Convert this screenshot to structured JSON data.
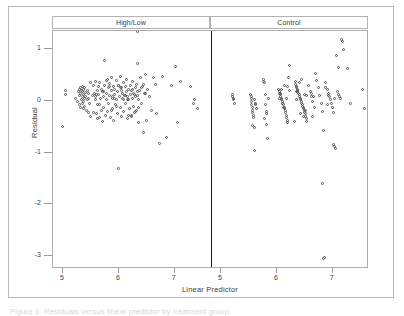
{
  "figure": {
    "panel_headers": [
      "High/Low",
      "Control"
    ],
    "xlabel": "Linear Predictor",
    "ylabel": "Residual",
    "caption_partial": "Figure 1. Residuals versus linear predictor by treatment group.",
    "colors": {
      "frame": "#aeaeae",
      "outer_border": "#b9b9b9",
      "divider": "#1a1a1a",
      "marker": "#555555",
      "text": "#3d3d3d",
      "background": "#ffffff"
    }
  },
  "chart_data": {
    "type": "scatter",
    "title": "",
    "xlabel": "Linear Predictor",
    "ylabel": "Residual",
    "xlim": [
      4.82,
      7.65
    ],
    "ylim": [
      -3.25,
      1.35
    ],
    "yticks": [
      1,
      0,
      -1,
      -2,
      -3
    ],
    "xticks": [
      5,
      6,
      7
    ],
    "grid": false,
    "legend": null,
    "marker": "open-circle",
    "panel_layout": "1x2",
    "panels": [
      {
        "name": "High/Low",
        "x": [
          4.99,
          5.05,
          5.05,
          5.23,
          5.26,
          5.28,
          5.29,
          5.3,
          5.3,
          5.31,
          5.32,
          5.32,
          5.33,
          5.33,
          5.34,
          5.34,
          5.35,
          5.35,
          5.36,
          5.36,
          5.37,
          5.37,
          5.38,
          5.38,
          5.39,
          5.4,
          5.41,
          5.42,
          5.43,
          5.44,
          5.45,
          5.46,
          5.47,
          5.49,
          5.52,
          5.55,
          5.56,
          5.58,
          5.59,
          5.6,
          5.61,
          5.62,
          5.63,
          5.64,
          5.65,
          5.66,
          5.67,
          5.68,
          5.69,
          5.7,
          5.71,
          5.72,
          5.73,
          5.74,
          5.75,
          5.76,
          5.77,
          5.78,
          5.79,
          5.8,
          5.81,
          5.82,
          5.83,
          5.84,
          5.85,
          5.86,
          5.87,
          5.88,
          5.89,
          5.9,
          5.91,
          5.92,
          5.93,
          5.94,
          5.95,
          5.96,
          5.97,
          5.98,
          5.99,
          6.0,
          6.01,
          6.02,
          6.03,
          6.04,
          6.05,
          6.06,
          6.07,
          6.08,
          6.09,
          6.1,
          6.11,
          6.12,
          6.13,
          6.14,
          6.15,
          6.16,
          6.17,
          6.18,
          6.19,
          6.2,
          6.21,
          6.22,
          6.23,
          6.24,
          6.25,
          6.26,
          6.27,
          6.28,
          6.29,
          6.3,
          6.31,
          6.32,
          6.33,
          6.34,
          6.35,
          6.36,
          6.37,
          6.38,
          6.4,
          6.42,
          6.44,
          6.46,
          6.48,
          6.5,
          6.52,
          6.55,
          6.58,
          6.62,
          6.65,
          6.68,
          6.72,
          6.78,
          6.85,
          6.95,
          7.02,
          7.05,
          7.1,
          7.28,
          7.34,
          7.36,
          7.4,
          5.72,
          6.02,
          6.3,
          5.6,
          5.88,
          6.18,
          6.44,
          5.45,
          5.95,
          6.25,
          6.48,
          5.66,
          5.84,
          6.08,
          6.34,
          5.54,
          5.78,
          6.12,
          6.36,
          5.49,
          5.92,
          6.22,
          6.41,
          5.58,
          5.86,
          6.05,
          6.28,
          5.62,
          5.99,
          6.15,
          6.33
        ],
        "y": [
          -0.5,
          0.2,
          0.12,
          0.05,
          -0.02,
          0.18,
          0.22,
          0.1,
          -0.08,
          0.25,
          0.15,
          -0.12,
          0.2,
          0.02,
          0.28,
          -0.05,
          0.18,
          0.08,
          -0.15,
          0.22,
          0.12,
          -0.02,
          0.26,
          0.05,
          -0.1,
          0.16,
          0.08,
          -0.18,
          0.2,
          0.02,
          -0.22,
          0.14,
          -0.05,
          -0.3,
          0.1,
          0.3,
          0.15,
          0.38,
          0.02,
          -0.25,
          0.2,
          -0.35,
          0.12,
          0.28,
          -0.08,
          0.35,
          0.05,
          -0.18,
          0.22,
          -0.4,
          0.18,
          0.08,
          -0.12,
          0.3,
          0.78,
          -0.28,
          0.15,
          0.02,
          0.42,
          -0.2,
          0.25,
          -0.05,
          0.33,
          0.1,
          -0.32,
          0.2,
          0.45,
          -0.15,
          0.05,
          0.28,
          -0.38,
          0.12,
          0.22,
          -0.08,
          0.4,
          0.02,
          -0.25,
          0.18,
          0.3,
          -1.3,
          0.08,
          0.48,
          -0.12,
          0.25,
          -0.3,
          0.15,
          0.05,
          0.35,
          -0.2,
          0.1,
          0.28,
          -0.05,
          0.18,
          0.42,
          -0.35,
          0.08,
          0.22,
          0.02,
          -0.15,
          0.3,
          0.12,
          -0.28,
          0.2,
          0.05,
          0.38,
          -0.1,
          0.15,
          -0.22,
          0.25,
          0.08,
          0.32,
          -0.18,
          0.1,
          0.73,
          0.02,
          -0.42,
          0.2,
          0.45,
          -0.05,
          0.28,
          -0.62,
          0.15,
          0.5,
          -0.38,
          0.22,
          0.08,
          -0.18,
          0.45,
          0.32,
          -0.25,
          -0.82,
          0.48,
          -0.7,
          0.3,
          0.67,
          -0.42,
          0.38,
          0.28,
          -0.05,
          0.02,
          -0.15,
          0.18,
          0.25,
          -0.2,
          0.12,
          0.08,
          -0.28,
          0.32,
          0.05,
          -0.1,
          0.22,
          0.15,
          -0.33,
          0.28,
          0.02,
          0.18,
          -0.22,
          0.4,
          0.1,
          -0.12,
          0.35,
          0.05,
          -0.3,
          0.25,
          0.08,
          -0.18,
          0.2,
          0.12,
          -0.08,
          0.3,
          0.02
        ],
        "n": 171
      },
      {
        "name": "Control",
        "x": [
          5.18,
          5.19,
          5.2,
          5.21,
          5.22,
          5.51,
          5.52,
          5.52,
          5.53,
          5.54,
          5.55,
          5.55,
          5.56,
          5.57,
          5.58,
          5.59,
          5.6,
          5.61,
          5.74,
          5.75,
          5.76,
          5.77,
          5.78,
          5.79,
          5.8,
          5.82,
          5.84,
          6.01,
          6.02,
          6.03,
          6.04,
          6.05,
          6.06,
          6.07,
          6.08,
          6.09,
          6.1,
          6.11,
          6.12,
          6.13,
          6.14,
          6.15,
          6.16,
          6.17,
          6.18,
          6.19,
          6.2,
          6.31,
          6.32,
          6.33,
          6.34,
          6.35,
          6.36,
          6.37,
          6.38,
          6.39,
          6.4,
          6.41,
          6.42,
          6.43,
          6.44,
          6.45,
          6.46,
          6.47,
          6.48,
          6.49,
          6.5,
          6.51,
          6.52,
          6.55,
          6.58,
          6.6,
          6.62,
          6.65,
          6.68,
          6.7,
          6.72,
          6.75,
          6.78,
          6.8,
          6.82,
          6.85,
          6.88,
          6.9,
          6.92,
          6.94,
          6.96,
          6.98,
          7.0,
          7.02,
          7.04,
          7.06,
          7.08,
          7.1,
          7.12,
          7.14,
          7.16,
          7.18,
          7.25,
          7.3,
          7.52,
          7.55,
          6.8,
          6.82,
          6.84,
          5.52,
          5.76,
          6.02,
          6.36,
          6.44,
          6.08,
          6.12,
          6.4,
          6.48,
          5.55,
          5.8,
          6.05,
          6.33,
          6.46,
          6.9,
          7.05,
          7.08,
          6.86,
          6.88,
          6.3,
          6.34,
          6.42,
          6.5,
          6.16,
          6.18,
          5.58,
          5.6,
          6.06,
          6.1,
          6.38,
          6.52,
          7.0,
          7.02,
          6.6,
          6.62,
          6.64,
          6.2
        ],
        "y": [
          0.12,
          0.08,
          0.05,
          0.02,
          -0.05,
          0.12,
          0.05,
          -0.02,
          -0.08,
          -0.12,
          -0.18,
          -0.22,
          -0.28,
          -0.32,
          0.02,
          -0.95,
          -0.05,
          -0.15,
          0.42,
          0.38,
          0.35,
          0.12,
          -0.08,
          -0.25,
          -0.45,
          -0.72,
          0.05,
          0.22,
          0.18,
          0.15,
          0.12,
          0.08,
          0.05,
          0.02,
          -0.02,
          -0.05,
          -0.08,
          -0.12,
          -0.15,
          -0.18,
          -0.22,
          -0.28,
          -0.32,
          -0.38,
          -0.42,
          0.45,
          0.68,
          0.38,
          0.32,
          0.28,
          0.25,
          0.22,
          0.18,
          0.15,
          0.12,
          0.08,
          0.05,
          0.02,
          -0.02,
          -0.05,
          -0.08,
          -0.12,
          -0.15,
          -0.18,
          -0.22,
          -0.25,
          -0.3,
          -0.35,
          -0.4,
          0.3,
          0.18,
          0.08,
          -0.02,
          -0.12,
          0.52,
          0.4,
          0.25,
          0.1,
          -0.05,
          -0.2,
          -0.58,
          0.35,
          0.22,
          0.15,
          0.08,
          0.02,
          -0.05,
          -0.12,
          -0.85,
          -0.88,
          -0.92,
          0.18,
          0.12,
          0.08,
          0.05,
          1.18,
          1.15,
          1.0,
          0.62,
          -0.05,
          0.22,
          -0.15,
          -1.6,
          -3.05,
          -3.02,
          0.08,
          -0.35,
          0.05,
          0.2,
          -0.1,
          -0.05,
          0.3,
          -0.25,
          0.12,
          -0.48,
          -0.2,
          0.15,
          0.02,
          -0.3,
          0.1,
          0.88,
          0.65,
          0.25,
          -0.08,
          -0.4,
          0.18,
          0.42,
          -0.18,
          0.05,
          0.28,
          -0.52,
          -0.08,
          0.22,
          -0.12,
          0.35,
          0.1,
          -0.22,
          0.05,
          0.15,
          -0.3,
          0.08,
          0.2,
          -0.05
        ],
        "n": 141
      }
    ]
  }
}
